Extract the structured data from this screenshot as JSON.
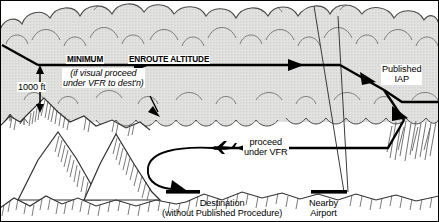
{
  "figure": {
    "kind": "aviation-procedure-diagram",
    "background_color": "#ffffff",
    "ink_color": "#000000",
    "cloud_fill": "#dededd",
    "width": 439,
    "height": 222
  },
  "labels": {
    "minimum": "MINIMUM",
    "enroute_altitude": "ENROUTE ALTITUDE",
    "vfr_note_line1": "(if visual proceed",
    "vfr_note_line2": "under VFR to dest'n)",
    "clearance": "1000 ft",
    "published_iap_line1": "Published",
    "published_iap_line2": "IAP",
    "proceed_line1": "proceed",
    "proceed_line2": "under VFR",
    "destination_line1": "Destination",
    "destination_line2": "(without Published Procedure)",
    "nearby_line1": "Nearby",
    "nearby_line2": "Airport"
  },
  "elements": {
    "cloud_layer": "cumulus-cloud-layer",
    "mountain_range": "hatched-mountain-range",
    "aircraft": "aircraft-silhouette",
    "destination_runway": "runway-bar",
    "nearby_runway": "runway-bar",
    "precipitation": "rain-shafts",
    "approach_cone": "approach-path-lines"
  }
}
